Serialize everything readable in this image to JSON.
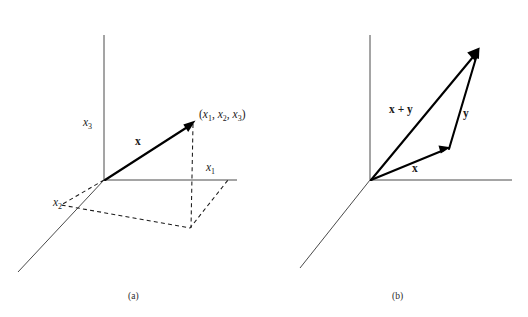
{
  "figure": {
    "background_color": "#ffffff",
    "ink_color": "#1a1a1a",
    "axis_color": "#4a4a4a",
    "panels": [
      {
        "id": "a",
        "caption": "(a)",
        "caption_pos": [
          128,
          292
        ],
        "origin": [
          104,
          180
        ],
        "axes": [
          {
            "name": "x3",
            "label": "x",
            "subscript": "3",
            "label_pos": [
              83,
              117
            ],
            "end": [
              104,
              35
            ]
          },
          {
            "name": "x1",
            "label": "x",
            "subscript": "1",
            "label_pos": [
              206,
              162
            ],
            "end": [
              237,
              180
            ]
          },
          {
            "name": "x2",
            "label": "x",
            "subscript": "2",
            "label_pos": [
              53,
              197
            ],
            "end": [
              18,
              272
            ]
          }
        ],
        "vectors": [
          {
            "name": "x",
            "label": "x",
            "label_pos": [
              135,
              136
            ],
            "from": [
              104,
              180
            ],
            "to": [
              193,
              122
            ]
          }
        ],
        "point_label": {
          "open": "(",
          "parts": [
            {
              "base": "x",
              "sub": "1"
            },
            {
              "base": "x",
              "sub": "2"
            },
            {
              "base": "x",
              "sub": "3"
            }
          ],
          "separator": ", ",
          "close": ")",
          "text": "(x1, x2, x3)",
          "pos": [
            199,
            109
          ]
        },
        "projection": {
          "description": "dashed drop-line from vector tip to base plane plus dashed parallelogram in the x1-x2 plane",
          "drop_from": [
            193,
            122
          ],
          "drop_to": [
            190,
            228
          ],
          "parallelogram": [
            [
              104,
              180
            ],
            [
              61,
              205
            ],
            [
              190,
              228
            ],
            [
              228,
              180
            ]
          ]
        }
      },
      {
        "id": "b",
        "caption": "(b)",
        "caption_pos": [
          392,
          292
        ],
        "origin": [
          370,
          180
        ],
        "axes": [
          {
            "name": "vertical",
            "label": "",
            "subscript": "",
            "label_pos": [
              0,
              0
            ],
            "end": [
              370,
              35
            ]
          },
          {
            "name": "horizontal",
            "label": "",
            "subscript": "",
            "label_pos": [
              0,
              0
            ],
            "end": [
              512,
              180
            ]
          },
          {
            "name": "diagonal",
            "label": "",
            "subscript": "",
            "label_pos": [
              0,
              0
            ],
            "end": [
              300,
              268
            ]
          }
        ],
        "vectors": [
          {
            "name": "x",
            "label": "x",
            "label_pos": [
              412,
              163
            ],
            "from": [
              370,
              180
            ],
            "to": [
              449,
              148
            ]
          },
          {
            "name": "y",
            "label": "y",
            "label_pos": [
              463,
              108
            ],
            "from": [
              449,
              148
            ],
            "to": [
              479,
              49
            ]
          },
          {
            "name": "x-plus-y",
            "label": "x + y",
            "label_pos": [
              389,
              104
            ],
            "from": [
              370,
              180
            ],
            "to": [
              479,
              49
            ]
          }
        ]
      }
    ]
  }
}
